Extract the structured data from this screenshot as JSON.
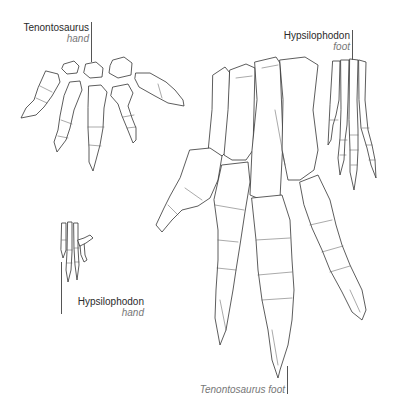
{
  "labels": {
    "tenontosaurus_hand": {
      "name": "Tenontosaurus",
      "part": "hand"
    },
    "hypsilophodon_foot": {
      "name": "Hypsilophodon",
      "part": "foot"
    },
    "hypsilophodon_hand": {
      "name": "Hypsilophodon",
      "part": "hand"
    },
    "tenontosaurus_foot": {
      "caption": "Tenontosaurus foot"
    }
  },
  "colors": {
    "line": "#333333",
    "text": "#2a2a2a",
    "subtext": "#777777",
    "background": "#ffffff"
  }
}
